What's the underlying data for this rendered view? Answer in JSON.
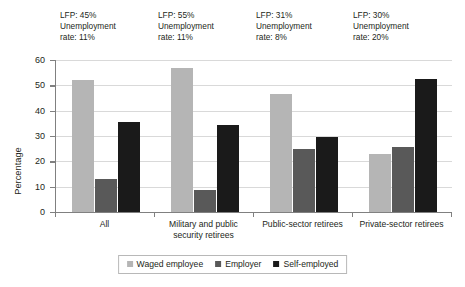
{
  "chart_data": {
    "type": "bar",
    "title": "",
    "subtitle": "",
    "xlabel": "",
    "ylabel": "Percentage",
    "ylim": [
      0,
      60
    ],
    "ytick_labels": [
      "0",
      "10",
      "20",
      "30",
      "40",
      "50",
      "60"
    ],
    "ytick_values": [
      0,
      10,
      20,
      30,
      40,
      50,
      60
    ],
    "grid": true,
    "legend_position": "bottom",
    "categories": [
      "All",
      "Military and public security retirees",
      "Public-sector retirees",
      "Private-sector retirees"
    ],
    "series": [
      {
        "name": "Waged employee",
        "color": "#b5b5b5",
        "values": [
          52,
          57,
          46.5,
          23
        ]
      },
      {
        "name": "Employer",
        "color": "#595959",
        "values": [
          13,
          8.5,
          25,
          25.5
        ]
      },
      {
        "name": "Self-employed",
        "color": "#1a1a1a",
        "values": [
          35.5,
          34.5,
          29.5,
          52.5
        ]
      }
    ],
    "annotations": [
      {
        "category": "All",
        "lines": [
          "LFP: 45%",
          "Unemployment",
          "rate: 11%"
        ],
        "lfp": "45%",
        "unemployment_rate": "11%"
      },
      {
        "category": "Military and public security retirees",
        "lines": [
          "LFP: 55%",
          "Unemployment",
          "rate: 11%"
        ],
        "lfp": "55%",
        "unemployment_rate": "11%"
      },
      {
        "category": "Public-sector retirees",
        "lines": [
          "LFP: 31%",
          "Unemployment",
          "rate: 8%"
        ],
        "lfp": "31%",
        "unemployment_rate": "8%"
      },
      {
        "category": "Private-sector retirees",
        "lines": [
          "LFP: 30%",
          "Unemployment",
          "rate: 20%"
        ],
        "lfp": "30%",
        "unemployment_rate": "20%"
      }
    ]
  },
  "axis": {
    "y_title": "Percentage",
    "y_labels": [
      "60",
      "50",
      "40",
      "30",
      "20",
      "10",
      "0"
    ]
  },
  "legend": {
    "items": [
      {
        "label": "Waged employee",
        "color": "#b5b5b5"
      },
      {
        "label": "Employer",
        "color": "#595959"
      },
      {
        "label": "Self-employed",
        "color": "#1a1a1a"
      }
    ]
  },
  "annotations_flat": {
    "g1l1": "LFP: 45%",
    "g1l2": "Unemployment",
    "g1l3": "rate: 11%",
    "g2l1": "LFP: 55%",
    "g2l2": "Unemployment",
    "g2l3": "rate: 11%",
    "g3l1": "LFP: 31%",
    "g3l2": "Unemployment",
    "g3l3": "rate: 8%",
    "g4l1": "LFP: 30%",
    "g4l2": "Unemployment",
    "g4l3": "rate: 20%"
  },
  "x_labels": {
    "c0": "All",
    "c1": "Military and public security retirees",
    "c2": "Public-sector retirees",
    "c3": "Private-sector retirees"
  }
}
